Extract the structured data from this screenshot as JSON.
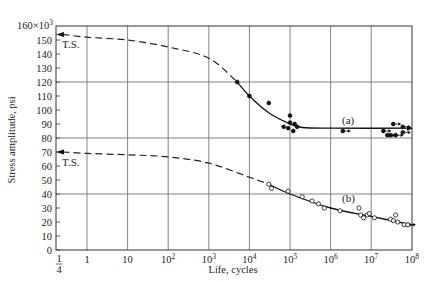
{
  "chart_data": {
    "type": "line",
    "title": "",
    "xlabel": "Life, cycles",
    "ylabel": "Stress amplitude, psi",
    "y_multiplier_label": "160×10³",
    "x_scale": "log",
    "xlim": [
      0.25,
      100000000
    ],
    "ylim": [
      0,
      160
    ],
    "grid": true,
    "x_tick_labels": [
      "1/4",
      "1",
      "10",
      "10²",
      "10³",
      "10⁴",
      "10⁵",
      "10⁶",
      "10⁷",
      "10⁸"
    ],
    "y_tick_labels": [
      "0",
      "10",
      "20",
      "30",
      "40",
      "50",
      "60",
      "70",
      "80",
      "90",
      "100",
      "110",
      "120",
      "130",
      "140",
      "150",
      "160×10³"
    ],
    "annotations": [
      {
        "text": "T.S.",
        "at": {
          "x": 0.25,
          "y": 154
        }
      },
      {
        "text": "T.S.",
        "at": {
          "x": 0.25,
          "y": 70
        }
      },
      {
        "text": "(a)",
        "at": {
          "x": 5000000,
          "y": 92
        }
      },
      {
        "text": "(b)",
        "at": {
          "x": 2500000,
          "y": 30
        }
      }
    ],
    "series": [
      {
        "name": "(a)",
        "marker": "filled-circle",
        "tensile_strength": 154,
        "curve": {
          "x": [
            0.25,
            1,
            10,
            100,
            1000,
            5000,
            10000,
            30000,
            100000,
            200000,
            1000000,
            100000000
          ],
          "y": [
            154,
            152,
            150,
            145,
            137,
            120,
            110,
            98,
            90,
            87.5,
            87,
            87
          ],
          "dashed_until_x": 5000
        },
        "points": [
          {
            "x": 5000,
            "y": 120
          },
          {
            "x": 10000,
            "y": 110
          },
          {
            "x": 30000,
            "y": 105
          },
          {
            "x": 70000,
            "y": 88
          },
          {
            "x": 90000,
            "y": 87
          },
          {
            "x": 100000,
            "y": 96
          },
          {
            "x": 100000,
            "y": 91
          },
          {
            "x": 120000,
            "y": 85
          },
          {
            "x": 130000,
            "y": 90
          },
          {
            "x": 150000,
            "y": 88
          }
        ],
        "runouts": [
          {
            "x": 2000000,
            "y": 85
          },
          {
            "x": 20000000,
            "y": 85
          },
          {
            "x": 25000000,
            "y": 82
          },
          {
            "x": 30000000,
            "y": 82
          },
          {
            "x": 40000000,
            "y": 82
          },
          {
            "x": 35000000,
            "y": 90
          },
          {
            "x": 60000000,
            "y": 88
          },
          {
            "x": 60000000,
            "y": 84
          }
        ]
      },
      {
        "name": "(b)",
        "marker": "open-circle",
        "tensile_strength": 70,
        "curve": {
          "x": [
            0.25,
            1,
            10,
            100,
            1000,
            10000,
            30000,
            100000,
            1000000,
            10000000,
            100000000
          ],
          "y": [
            70,
            69,
            68,
            66.5,
            62,
            52,
            47,
            40,
            30,
            24,
            18
          ],
          "dashed_until_x": 30000
        },
        "points": [
          {
            "x": 30000,
            "y": 47
          },
          {
            "x": 35000,
            "y": 44
          },
          {
            "x": 90000,
            "y": 42
          },
          {
            "x": 200000,
            "y": 38
          },
          {
            "x": 350000,
            "y": 35
          },
          {
            "x": 500000,
            "y": 33
          },
          {
            "x": 700000,
            "y": 30
          },
          {
            "x": 1700000,
            "y": 28
          },
          {
            "x": 5000000,
            "y": 30
          },
          {
            "x": 5500000,
            "y": 25
          },
          {
            "x": 6500000,
            "y": 23
          },
          {
            "x": 8000000,
            "y": 25
          },
          {
            "x": 9000000,
            "y": 26
          },
          {
            "x": 12000000,
            "y": 23
          },
          {
            "x": 30000000,
            "y": 22
          },
          {
            "x": 35000000,
            "y": 21
          },
          {
            "x": 40000000,
            "y": 25
          },
          {
            "x": 45000000,
            "y": 20
          },
          {
            "x": 65000000,
            "y": 18
          }
        ],
        "runouts": [
          {
            "x": 80000000,
            "y": 18
          }
        ]
      }
    ]
  },
  "plot": {
    "ts_label_a": "T.S.",
    "ts_label_b": "T.S.",
    "curve_a_label": "(a)",
    "curve_b_label": "(b)",
    "xlabel": "Life, cycles",
    "ylabel": "Stress amplitude, psi",
    "y_top_label": "160×10",
    "y_top_exp": "3"
  }
}
